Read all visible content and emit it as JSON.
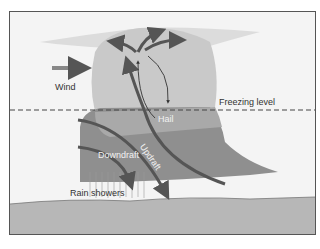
{
  "diagram": {
    "type": "thunderstorm cross-section",
    "labels": {
      "wind": "Wind",
      "freezing_level": "Freezing level",
      "hail": "Hail",
      "updraft": "Updraft",
      "downdraft": "Downdraft",
      "rain_showers": "Rain showers"
    },
    "colors": {
      "background": "#f4f4f4",
      "cloud_light": "#c8c8c8",
      "cloud_dark": "#8e8e8e",
      "arrow": "#555555",
      "ground": "#b4b4b4"
    }
  }
}
